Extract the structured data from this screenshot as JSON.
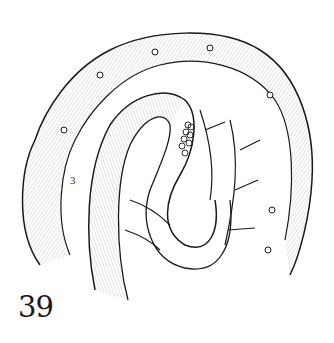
{
  "figure": {
    "number": "39",
    "inner_label": "3",
    "colors": {
      "ink": "#1a1a1a",
      "background": "#ffffff"
    }
  }
}
